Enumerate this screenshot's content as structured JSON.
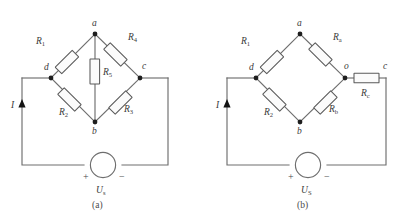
{
  "figure": {
    "domain": "diagram",
    "colors": {
      "wire": "#6e6e6e",
      "resistor_outline": "#5a5a5a",
      "resistor_fill": "#fbfbfb",
      "node": "#1e1e1e",
      "text": "#3a3a3a",
      "background": "#ffffff"
    }
  },
  "panels": [
    {
      "caption": "(a)",
      "nodes": [
        {
          "id": "a",
          "label": "a"
        },
        {
          "id": "b",
          "label": "b"
        },
        {
          "id": "c",
          "label": "c"
        },
        {
          "id": "d",
          "label": "d"
        }
      ],
      "resistors": [
        {
          "id": "R1",
          "name": "R",
          "sub": "1",
          "position": "upper-left-arm"
        },
        {
          "id": "R4",
          "name": "R",
          "sub": "4",
          "position": "upper-right-arm"
        },
        {
          "id": "R5",
          "name": "R",
          "sub": "5",
          "position": "bridge-middle"
        },
        {
          "id": "R2",
          "name": "R",
          "sub": "2",
          "position": "lower-left-arm"
        },
        {
          "id": "R3",
          "name": "R",
          "sub": "3",
          "position": "lower-right-arm"
        }
      ],
      "source": {
        "name": "U",
        "sub": "s",
        "plus": "+",
        "minus": "−"
      },
      "current": {
        "label": "I",
        "direction": "up"
      }
    },
    {
      "caption": "(b)",
      "nodes": [
        {
          "id": "a",
          "label": "a"
        },
        {
          "id": "b",
          "label": "b"
        },
        {
          "id": "c",
          "label": "c"
        },
        {
          "id": "d",
          "label": "d"
        },
        {
          "id": "o",
          "label": "o"
        }
      ],
      "resistors": [
        {
          "id": "R1",
          "name": "R",
          "sub": "1",
          "position": "upper-left-arm"
        },
        {
          "id": "Ra",
          "name": "R",
          "sub": "a",
          "position": "upper-right-arm"
        },
        {
          "id": "R2",
          "name": "R",
          "sub": "2",
          "position": "lower-left-arm"
        },
        {
          "id": "Rb",
          "name": "R",
          "sub": "b",
          "position": "lower-right-arm"
        },
        {
          "id": "Rc",
          "name": "R",
          "sub": "c",
          "position": "series-o-to-c"
        }
      ],
      "source": {
        "name": "U",
        "sub": "S",
        "plus": "+",
        "minus": "−"
      },
      "current": {
        "label": "I",
        "direction": "up"
      }
    }
  ]
}
